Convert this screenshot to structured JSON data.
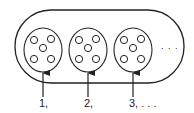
{
  "diagram": {
    "container": {
      "x": 15,
      "y": 10,
      "width": 169,
      "height": 73,
      "shape": "stadium"
    },
    "sets": [
      {
        "index": 1,
        "label": "1,",
        "cx": 43,
        "cy": 50,
        "rx": 19,
        "ry": 22,
        "elements": 5
      },
      {
        "index": 2,
        "label": "2,",
        "cx": 88,
        "cy": 50,
        "rx": 19,
        "ry": 22,
        "elements": 5
      },
      {
        "index": 3,
        "label": "3, . . .",
        "cx": 133,
        "cy": 50,
        "rx": 19,
        "ry": 22,
        "elements": 5
      }
    ],
    "ellipsis": ". . .",
    "stroke_color": "#222222",
    "background": "#ffffff"
  }
}
